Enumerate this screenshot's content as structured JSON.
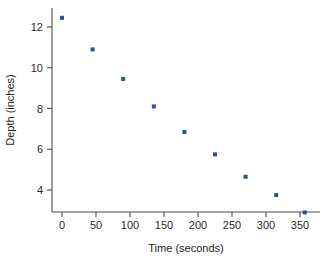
{
  "chart_data": {
    "type": "scatter",
    "title": "",
    "xlabel": "Time (seconds)",
    "ylabel": "Depth (inches)",
    "xlim": [
      -18,
      375
    ],
    "ylim": [
      2.3,
      13.1
    ],
    "xticks": [
      0,
      50,
      100,
      150,
      200,
      250,
      300,
      350
    ],
    "yticks": [
      4,
      6,
      8,
      10,
      12
    ],
    "grid": false,
    "legend": null,
    "marker_color": "#2b4fa2",
    "axis_color": "#4a4a4a",
    "points": [
      {
        "x": 0,
        "y": 12.45
      },
      {
        "x": 45,
        "y": 10.9
      },
      {
        "x": 90,
        "y": 9.45
      },
      {
        "x": 135,
        "y": 8.1
      },
      {
        "x": 180,
        "y": 6.85
      },
      {
        "x": 225,
        "y": 5.75
      },
      {
        "x": 270,
        "y": 4.65
      },
      {
        "x": 315,
        "y": 3.75
      },
      {
        "x": 357,
        "y": 2.9
      }
    ]
  }
}
